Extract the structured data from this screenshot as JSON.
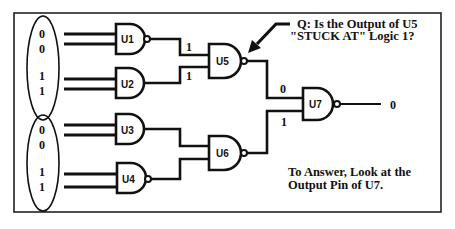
{
  "diagram": {
    "question_line1": "Q:  Is the Output of U5",
    "question_line2": "\"STUCK AT\" Logic 1?",
    "answer_line1": "To Answer, Look at the",
    "answer_line2": "Output Pin of U7.",
    "gates": {
      "u1": {
        "label": "U1",
        "type": "NAND"
      },
      "u2": {
        "label": "U2",
        "type": "AND"
      },
      "u3": {
        "label": "U3",
        "type": "AND"
      },
      "u4": {
        "label": "U4",
        "type": "NAND"
      },
      "u5": {
        "label": "U5",
        "type": "NAND"
      },
      "u6": {
        "label": "U6",
        "type": "NAND"
      },
      "u7": {
        "label": "U7",
        "type": "NAND"
      }
    },
    "inputs_top": [
      "0",
      "0",
      "1",
      "1"
    ],
    "inputs_bottom": [
      "0",
      "0",
      "1",
      "1"
    ],
    "signals": {
      "u5_in_a": "1",
      "u5_in_b": "1",
      "u7_in_a": "0",
      "u7_in_b": "1",
      "u7_out": "0"
    }
  }
}
